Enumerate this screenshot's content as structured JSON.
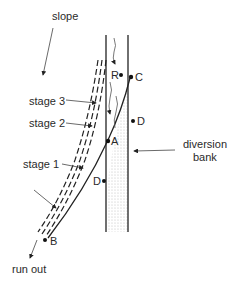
{
  "diagram": {
    "labels": {
      "slope": "slope",
      "stage3": "stage 3",
      "stage2": "stage 2",
      "stage1": "stage 1",
      "diversion_bank_line1": "diversion",
      "diversion_bank_line2": "bank",
      "run_out": "run out"
    },
    "points": {
      "R": "R",
      "C": "C",
      "D_upper": "D",
      "A": "A",
      "D_lower": "D",
      "B": "B"
    },
    "colors": {
      "line": "#222222",
      "shade": "#d8d8d8",
      "background": "#ffffff"
    }
  }
}
